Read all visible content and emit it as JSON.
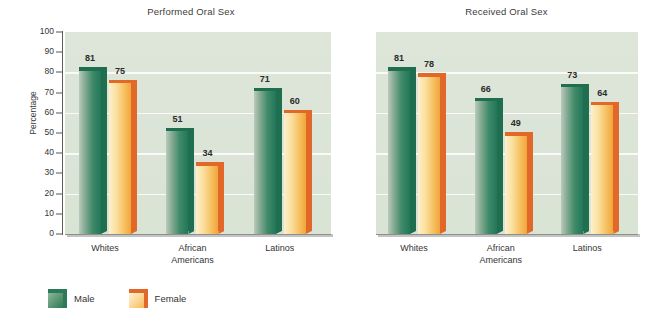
{
  "chart_data": [
    {
      "type": "bar",
      "title": "Performed Oral Sex",
      "xlabel": "",
      "ylabel": "Percentage",
      "ylim": [
        0,
        100
      ],
      "ytick_step": 10,
      "yticks": [
        100,
        90,
        80,
        70,
        60,
        50,
        40,
        30,
        20,
        10,
        0
      ],
      "gridlines": [
        20,
        40,
        60,
        80
      ],
      "grid": true,
      "legend_position": "bottom-left",
      "categories": [
        "Whites",
        "African\nAmericans",
        "Latinos"
      ],
      "series": [
        {
          "name": "Male",
          "color": "#2d7a58",
          "values": [
            81,
            51,
            71
          ]
        },
        {
          "name": "Female",
          "color": "#f7b858",
          "values": [
            75,
            34,
            60
          ]
        }
      ]
    },
    {
      "type": "bar",
      "title": "Received Oral Sex",
      "xlabel": "",
      "ylabel": "",
      "ylim": [
        0,
        100
      ],
      "ytick_step": 10,
      "yticks": [],
      "gridlines": [
        20,
        40,
        60,
        80
      ],
      "grid": true,
      "legend_position": "bottom-left",
      "categories": [
        "Whites",
        "African\nAmericans",
        "Latinos"
      ],
      "series": [
        {
          "name": "Male",
          "color": "#2d7a58",
          "values": [
            81,
            66,
            73
          ]
        },
        {
          "name": "Female",
          "color": "#f7b858",
          "values": [
            78,
            49,
            64
          ]
        }
      ]
    }
  ],
  "left_chart": {
    "title": "Performed Oral Sex",
    "ylabel": "Percentage",
    "yticks": [
      "100",
      "90",
      "80",
      "70",
      "60",
      "50",
      "40",
      "30",
      "20",
      "10",
      "0"
    ],
    "categories": [
      "Whites",
      "African\nAmericans",
      "Latinos"
    ],
    "bars": [
      {
        "series": "Male",
        "category": "Whites",
        "value": 81,
        "label": "81"
      },
      {
        "series": "Female",
        "category": "Whites",
        "value": 75,
        "label": "75"
      },
      {
        "series": "Male",
        "category": "African Americans",
        "value": 51,
        "label": "51"
      },
      {
        "series": "Female",
        "category": "African Americans",
        "value": 34,
        "label": "34"
      },
      {
        "series": "Male",
        "category": "Latinos",
        "value": 71,
        "label": "71"
      },
      {
        "series": "Female",
        "category": "Latinos",
        "value": 60,
        "label": "60"
      }
    ]
  },
  "right_chart": {
    "title": "Received Oral Sex",
    "ylabel": "",
    "categories": [
      "Whites",
      "African\nAmericans",
      "Latinos"
    ],
    "bars": [
      {
        "series": "Male",
        "category": "Whites",
        "value": 81,
        "label": "81"
      },
      {
        "series": "Female",
        "category": "Whites",
        "value": 78,
        "label": "78"
      },
      {
        "series": "Male",
        "category": "African Americans",
        "value": 66,
        "label": "66"
      },
      {
        "series": "Female",
        "category": "African Americans",
        "value": 49,
        "label": "49"
      },
      {
        "series": "Male",
        "category": "Latinos",
        "value": 73,
        "label": "73"
      },
      {
        "series": "Female",
        "category": "Latinos",
        "value": 64,
        "label": "64"
      }
    ]
  },
  "legend": {
    "items": [
      {
        "label": "Male",
        "color": "#2d7a58"
      },
      {
        "label": "Female",
        "color": "#f7b858"
      }
    ]
  },
  "colors": {
    "plot_background": "#d9e3d4",
    "male_bar": "#2d7a58",
    "female_bar": "#f7b858",
    "male_edge": "#1f6e50",
    "female_edge": "#e2682a",
    "gridline": "#ffffff",
    "text": "#343434"
  }
}
